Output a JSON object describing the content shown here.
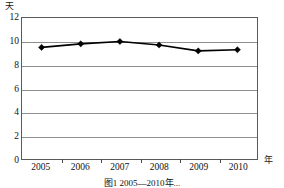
{
  "chart_data": {
    "type": "line",
    "title": "",
    "categories": [
      "2005",
      "2006",
      "2007",
      "2008",
      "2009",
      "2010"
    ],
    "values": [
      9.5,
      9.8,
      10.0,
      9.7,
      9.2,
      9.3
    ],
    "series": [
      {
        "name": "",
        "values": [
          9.5,
          9.8,
          10.0,
          9.7,
          9.2,
          9.3
        ]
      }
    ],
    "xlabel": "年",
    "ylabel": "天",
    "ylim": [
      0,
      12
    ],
    "yticks": [
      0,
      2,
      4,
      6,
      8,
      10,
      12
    ],
    "ytick_labels": [
      "0",
      "2",
      "4",
      "6",
      "8",
      "10",
      "12"
    ],
    "grid": true,
    "legend": "none",
    "marker": "diamond",
    "line_color": "#000000",
    "grid_color": "#8f8f8f",
    "frame_color": "#5a5a5a"
  },
  "axes": {
    "y_unit": "天",
    "x_unit": "年"
  },
  "caption": {
    "text": "图1   2005—2010年..."
  }
}
